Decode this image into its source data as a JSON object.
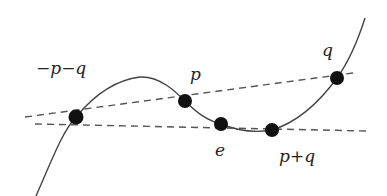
{
  "diagram": {
    "colors": {
      "curve": "#444444",
      "dashed": "#555555",
      "point": "#111111",
      "text": "#222222"
    },
    "points": [
      {
        "id": "neg-p-q",
        "label": "−p−q",
        "x": 76,
        "y": 117,
        "label_x": 47,
        "label_y": 74
      },
      {
        "id": "p",
        "label": "p",
        "x": 185,
        "y": 101,
        "label_x": 190,
        "label_y": 80
      },
      {
        "id": "e",
        "label": "e",
        "x": 221,
        "y": 124,
        "label_x": 215,
        "label_y": 153
      },
      {
        "id": "p-plus-q",
        "label": "p+q",
        "x": 272,
        "y": 130,
        "label_x": 279,
        "label_y": 162
      },
      {
        "id": "q",
        "label": "q",
        "x": 337,
        "y": 78,
        "label_x": 322,
        "label_y": 54
      }
    ],
    "lines": [
      {
        "id": "line-through-p-q",
        "from": [
          25,
          117
        ],
        "to": [
          353,
          73
        ]
      },
      {
        "id": "line-through-e",
        "from": [
          35,
          124
        ],
        "to": [
          367,
          131
        ]
      }
    ]
  }
}
